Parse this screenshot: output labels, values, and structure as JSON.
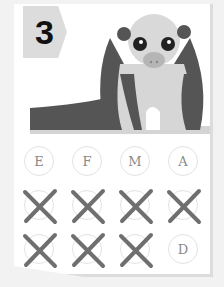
{
  "card": {
    "number": "3",
    "illustration": "tree-anteater-icon",
    "colors": {
      "tag_bg": "#dcdcdc",
      "animal_dark": "#555555",
      "animal_light": "#d8d8d8",
      "cross": "#6f6f6f"
    }
  },
  "letters": [
    {
      "label": "E",
      "crossed": false
    },
    {
      "label": "F",
      "crossed": false
    },
    {
      "label": "M",
      "crossed": false
    },
    {
      "label": "A",
      "crossed": false
    },
    {
      "label": "",
      "crossed": true
    },
    {
      "label": "",
      "crossed": true
    },
    {
      "label": "",
      "crossed": true
    },
    {
      "label": "",
      "crossed": true
    },
    {
      "label": "",
      "crossed": true
    },
    {
      "label": "",
      "crossed": true
    },
    {
      "label": "",
      "crossed": true
    },
    {
      "label": "D",
      "crossed": false
    }
  ]
}
